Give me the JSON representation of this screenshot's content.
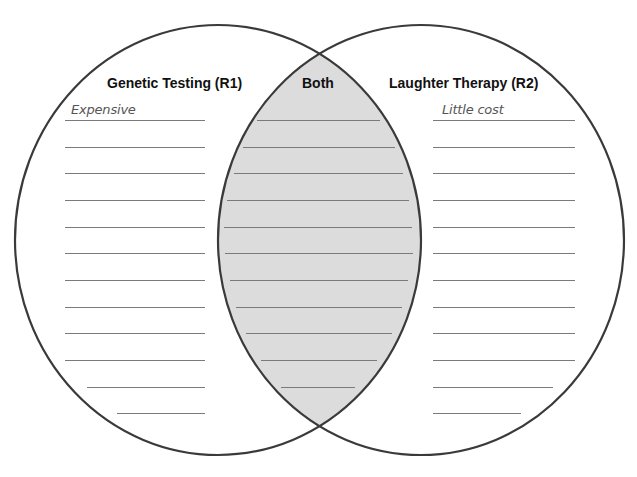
{
  "diagram": {
    "type": "venn",
    "colors": {
      "stroke": "#3a3a3a",
      "overlap_fill": "#dcdcdc",
      "line": "#7a7a7a",
      "background": "#ffffff"
    },
    "left": {
      "title": "Genetic Testing (R1)",
      "entries": [
        "Expensive"
      ]
    },
    "middle": {
      "title": "Both",
      "entries": []
    },
    "right": {
      "title": "Laughter Therapy (R2)",
      "entries": [
        "Little cost"
      ]
    }
  }
}
